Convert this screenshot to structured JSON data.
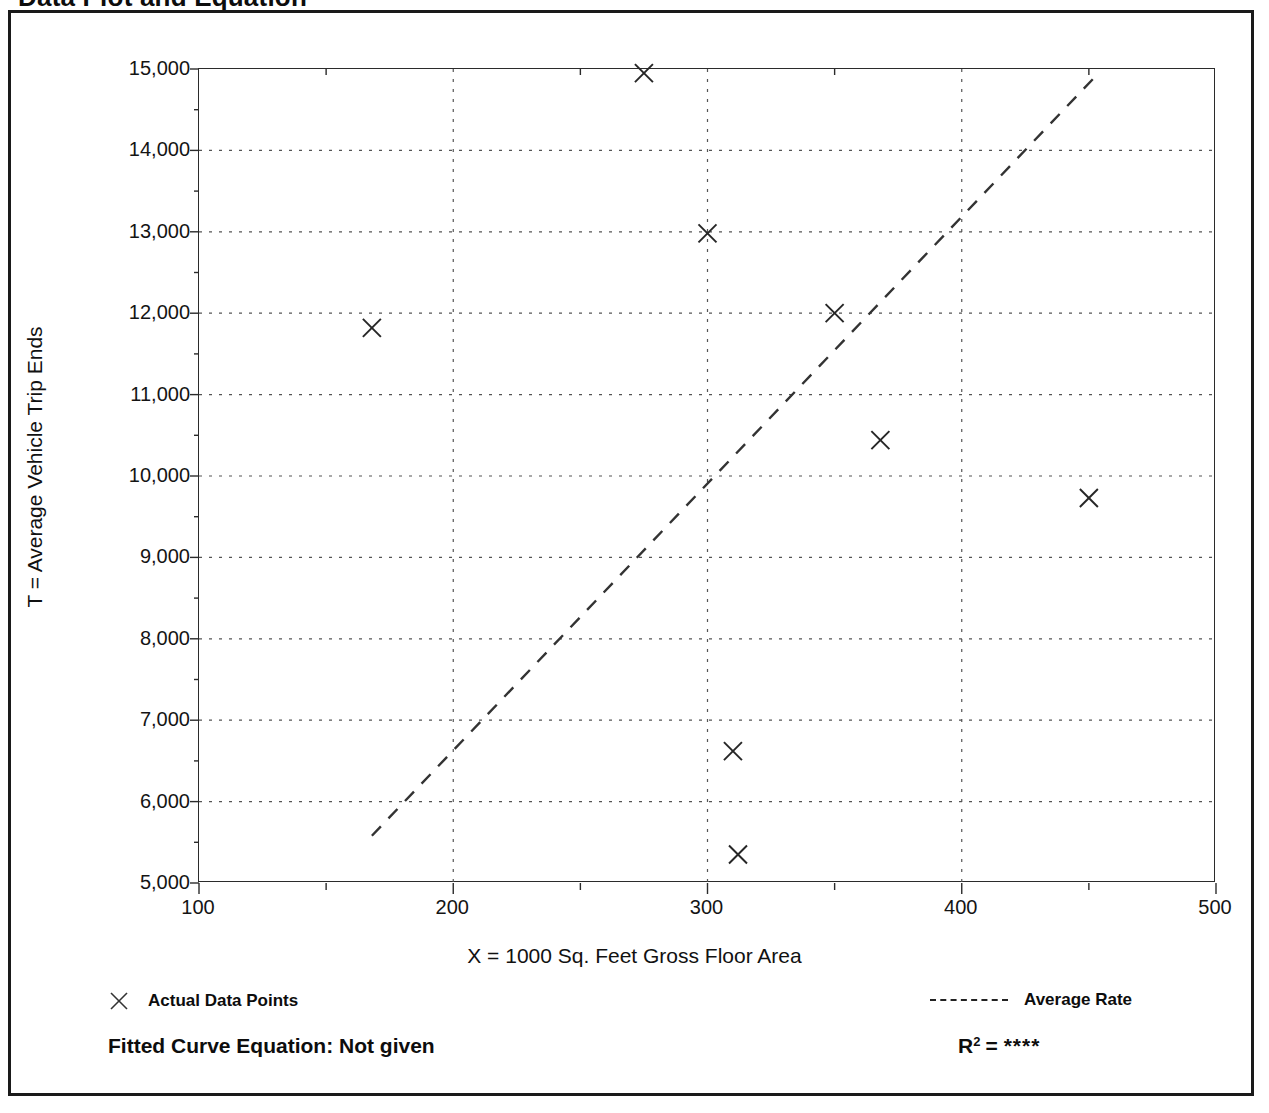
{
  "document": {
    "title": "Data Plot and Equation"
  },
  "axes": {
    "y_title": "T = Average Vehicle Trip Ends",
    "x_title": "X = 1000 Sq. Feet Gross Floor Area"
  },
  "legend": {
    "actual_points_label": "Actual Data Points",
    "actual_points_icon": "x-marker-icon",
    "average_rate_label": "Average Rate",
    "average_rate_icon": "dashed-line-icon"
  },
  "footer": {
    "fitted_curve_label": "Fitted Curve Equation:  Not given",
    "r2_label": "R",
    "r2_exponent": "2",
    "r2_equals": "=",
    "r2_value": "****"
  },
  "chart_data": {
    "type": "scatter",
    "title": "Data Plot and Equation",
    "xlabel": "X = 1000 Sq. Feet Gross Floor Area",
    "ylabel": "T = Average Vehicle Trip Ends",
    "xlim": [
      100,
      500
    ],
    "ylim": [
      5000,
      15000
    ],
    "xticks": [
      100,
      200,
      300,
      400,
      500
    ],
    "yticks": [
      5000,
      6000,
      7000,
      8000,
      9000,
      10000,
      11000,
      12000,
      13000,
      14000,
      15000
    ],
    "ytick_labels": [
      "5,000",
      "6,000",
      "7,000",
      "8,000",
      "9,000",
      "10,000",
      "11,000",
      "12,000",
      "13,000",
      "14,000",
      "15,000"
    ],
    "xtick_labels": [
      "100",
      "200",
      "300",
      "400",
      "500"
    ],
    "x_minor_ticks": [
      150,
      250,
      350,
      450
    ],
    "y_minor_ticks": [
      5500,
      6500,
      7500,
      8500,
      9500,
      10500,
      11500,
      12500,
      13500,
      14500
    ],
    "grid": "dotted-both-axes",
    "legend_position": "below-plot",
    "series": [
      {
        "name": "Actual Data Points",
        "marker": "x",
        "points": [
          {
            "x": 168,
            "y": 11820
          },
          {
            "x": 275,
            "y": 14950
          },
          {
            "x": 300,
            "y": 12980
          },
          {
            "x": 310,
            "y": 6620
          },
          {
            "x": 312,
            "y": 5350
          },
          {
            "x": 350,
            "y": 12000
          },
          {
            "x": 368,
            "y": 10440
          },
          {
            "x": 450,
            "y": 9730
          }
        ]
      },
      {
        "name": "Average Rate",
        "style": "dashed-line",
        "line": [
          {
            "x": 168,
            "y": 5580
          },
          {
            "x": 452,
            "y": 14890
          }
        ]
      }
    ]
  }
}
